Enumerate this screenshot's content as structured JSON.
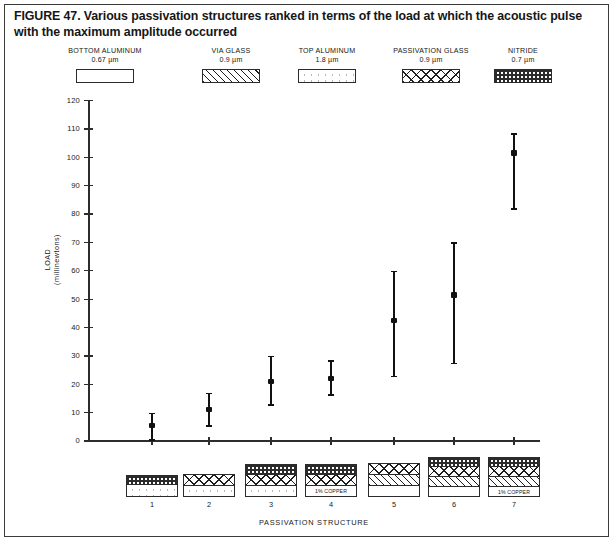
{
  "figure": {
    "caption": "FIGURE 47. Various passivation structures ranked in terms of the load at which the acoustic pulse with the maximum amplitude occurred"
  },
  "materials_legend": {
    "items": [
      {
        "name": "BOTTOM ALUMINUM",
        "thickness": "0.67 µm",
        "fill": "blank"
      },
      {
        "name": "VIA GLASS",
        "thickness": "0.9 µm",
        "fill": "diagonal-hatch"
      },
      {
        "name": "TOP ALUMINUM",
        "thickness": "1.8 µm",
        "fill": "dotted"
      },
      {
        "name": "PASSIVATION GLASS",
        "thickness": "0.9 µm",
        "fill": "cross-hatch"
      },
      {
        "name": "NITRIDE",
        "thickness": "0.7 µm",
        "fill": "nitride-dark-dots"
      }
    ]
  },
  "chart_data": {
    "type": "scatter",
    "title": "Various passivation structures ranked in terms of the load at which the acoustic pulse with the maximum amplitude occurred",
    "xlabel": "PASSIVATION STRUCTURE",
    "ylabel": "LOAD (millinewtons)",
    "ylabel_line1": "LOAD",
    "ylabel_line2": "(millinewtons)",
    "categories": [
      "1",
      "2",
      "3",
      "4",
      "5",
      "6",
      "7"
    ],
    "x": [
      1,
      2,
      3,
      4,
      5,
      6,
      7
    ],
    "values": [
      5.5,
      11,
      21,
      22,
      42.5,
      51.5,
      101.5
    ],
    "error_low": [
      0,
      5,
      12.5,
      16,
      22.5,
      27,
      81.5
    ],
    "error_high": [
      10,
      17,
      30,
      28.5,
      60,
      70,
      108.5
    ],
    "ylim": [
      0,
      120
    ],
    "ytick_labels": [
      "0",
      "10",
      "20",
      "30",
      "40",
      "50",
      "60",
      "70",
      "80",
      "90",
      "100",
      "110",
      "120"
    ],
    "yticks": [
      0,
      10,
      20,
      30,
      40,
      50,
      60,
      70,
      80,
      90,
      100,
      110,
      120
    ],
    "grid": false,
    "legend_position": "top"
  },
  "structure_legend": {
    "axis_label": "PASSIVATION STRUCTURE",
    "stacks": [
      {
        "id": "1",
        "layers": [
          {
            "fill": "nitride-dark-dots",
            "height": 9,
            "label": ""
          },
          {
            "fill": "dotted",
            "height": 11,
            "label": ""
          }
        ]
      },
      {
        "id": "2",
        "layers": [
          {
            "fill": "cross-hatch",
            "height": 11,
            "label": ""
          },
          {
            "fill": "dotted",
            "height": 10,
            "label": ""
          }
        ]
      },
      {
        "id": "3",
        "layers": [
          {
            "fill": "nitride-dark-dots",
            "height": 10,
            "label": ""
          },
          {
            "fill": "cross-hatch",
            "height": 11,
            "label": ""
          },
          {
            "fill": "dotted",
            "height": 10,
            "label": ""
          }
        ]
      },
      {
        "id": "4",
        "layers": [
          {
            "fill": "nitride-dark-dots",
            "height": 10,
            "label": ""
          },
          {
            "fill": "cross-hatch",
            "height": 11,
            "label": ""
          },
          {
            "fill": "blank",
            "height": 10,
            "label": "1% COPPER"
          }
        ]
      },
      {
        "id": "5",
        "layers": [
          {
            "fill": "cross-hatch",
            "height": 11,
            "label": ""
          },
          {
            "fill": "diagonal-hatch",
            "height": 11,
            "label": ""
          },
          {
            "fill": "blank",
            "height": 10,
            "label": ""
          }
        ]
      },
      {
        "id": "6",
        "layers": [
          {
            "fill": "nitride-dark-dots",
            "height": 9,
            "label": ""
          },
          {
            "fill": "cross-hatch",
            "height": 10,
            "label": ""
          },
          {
            "fill": "diagonal-hatch",
            "height": 10,
            "label": ""
          },
          {
            "fill": "blank",
            "height": 9,
            "label": ""
          }
        ]
      },
      {
        "id": "7",
        "layers": [
          {
            "fill": "nitride-dark-dots",
            "height": 9,
            "label": ""
          },
          {
            "fill": "cross-hatch",
            "height": 10,
            "label": ""
          },
          {
            "fill": "diagonal-hatch",
            "height": 10,
            "label": ""
          },
          {
            "fill": "blank",
            "height": 9,
            "label": "1% COPPER"
          }
        ]
      }
    ]
  },
  "colors": {
    "ink": "#161616",
    "axis": "#2d2d2d",
    "marker": "#111111",
    "border": "#3a3a3a",
    "page": "#ffffff"
  }
}
